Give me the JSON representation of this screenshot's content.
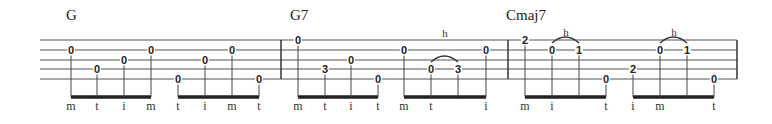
{
  "staff": {
    "left": 40,
    "right": 737,
    "string_y": [
      40,
      50,
      60,
      69,
      79
    ],
    "barlines": [
      281,
      508,
      737
    ],
    "line_color": "#555555",
    "beam_y": 97
  },
  "chords": [
    {
      "label": "G",
      "x": 66
    },
    {
      "label": "G7",
      "x": 290
    },
    {
      "label": "Cmaj7",
      "x": 506
    }
  ],
  "groups": [
    {
      "notes": [
        {
          "x": 71,
          "string": 2,
          "fret": "0",
          "finger": "m"
        },
        {
          "x": 97,
          "string": 4,
          "fret": "0",
          "finger": "t"
        },
        {
          "x": 124,
          "string": 3,
          "fret": "0",
          "finger": "i"
        },
        {
          "x": 151,
          "string": 2,
          "fret": "0",
          "finger": "m"
        }
      ]
    },
    {
      "notes": [
        {
          "x": 178,
          "string": 5,
          "fret": "0",
          "finger": "t"
        },
        {
          "x": 205,
          "string": 3,
          "fret": "0",
          "finger": "i"
        },
        {
          "x": 232,
          "string": 2,
          "fret": "0",
          "finger": "m"
        },
        {
          "x": 259,
          "string": 5,
          "fret": "0",
          "finger": "t"
        }
      ]
    },
    {
      "notes": [
        {
          "x": 298,
          "string": 1,
          "fret": "0",
          "finger": "m"
        },
        {
          "x": 325,
          "string": 4,
          "fret": "3",
          "finger": "t"
        },
        {
          "x": 351,
          "string": 3,
          "fret": "0",
          "finger": "i"
        },
        {
          "x": 378,
          "string": 5,
          "fret": "0",
          "finger": "t"
        }
      ]
    },
    {
      "notes": [
        {
          "x": 404,
          "string": 2,
          "fret": "0",
          "finger": "m"
        },
        {
          "x": 431,
          "string": 4,
          "fret": "0",
          "finger": "t"
        },
        {
          "x": 458,
          "string": 4,
          "fret": "3",
          "finger": ""
        },
        {
          "x": 486,
          "string": 2,
          "fret": "0",
          "finger": "i"
        }
      ]
    },
    {
      "notes": [
        {
          "x": 525,
          "string": 1,
          "fret": "2",
          "finger": "m"
        },
        {
          "x": 552,
          "string": 2,
          "fret": "0",
          "finger": "i"
        },
        {
          "x": 579,
          "string": 2,
          "fret": "1",
          "finger": ""
        },
        {
          "x": 606,
          "string": 5,
          "fret": "0",
          "finger": "t"
        }
      ]
    },
    {
      "notes": [
        {
          "x": 633,
          "string": 4,
          "fret": "2",
          "finger": "i"
        },
        {
          "x": 660,
          "string": 2,
          "fret": "0",
          "finger": "m"
        },
        {
          "x": 687,
          "string": 2,
          "fret": "1",
          "finger": ""
        },
        {
          "x": 714,
          "string": 5,
          "fret": "0",
          "finger": "t"
        }
      ]
    }
  ],
  "hammer_ons": [
    {
      "from_x": 431,
      "to_x": 458,
      "string": 4,
      "label": "h",
      "label_x": 445,
      "label_y": 28
    },
    {
      "from_x": 552,
      "to_x": 579,
      "string": 2,
      "label": "h",
      "label_x": 566,
      "label_y": 27
    },
    {
      "from_x": 660,
      "to_x": 687,
      "string": 2,
      "label": "h",
      "label_x": 674,
      "label_y": 27
    }
  ]
}
